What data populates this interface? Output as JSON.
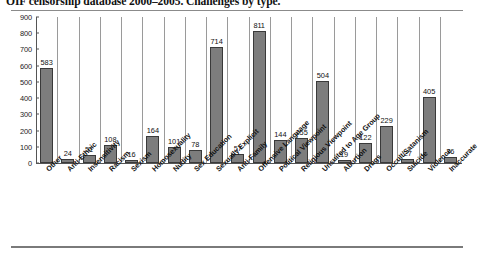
{
  "chart_data": {
    "type": "bar",
    "title": "OIF censorship database 2000–2005. Challenges by type.",
    "xlabel": "",
    "ylabel": "",
    "ylim": [
      0,
      900
    ],
    "ytick_step": 100,
    "grid": true,
    "legend": "none",
    "orientation": "vertical",
    "bar_color": "#7d7d7d",
    "categories": [
      "Other",
      "Anti-Ethnic",
      "Insensitivity",
      "Racism",
      "Sexism",
      "Homosexuality",
      "Nudity",
      "Sex Education",
      "Sexually Explicit",
      "Anti-Family",
      "Offensive Language",
      "Political Viewpoint",
      "Religious Viewpoint",
      "Unsuited to Age Group",
      "Abortion",
      "Drugs",
      "Occult/Satanism",
      "Suicide",
      "Violence",
      "Inaccurate"
    ],
    "values": [
      583,
      24,
      51,
      108,
      16,
      164,
      101,
      78,
      714,
      57,
      811,
      144,
      155,
      504,
      19,
      122,
      229,
      27,
      405,
      36
    ],
    "yticks": [
      0,
      100,
      200,
      300,
      400,
      500,
      600,
      700,
      800,
      900
    ],
    "ytick_labels": [
      "0",
      "100",
      "200",
      "300",
      "400",
      "500",
      "600",
      "700",
      "800",
      "900"
    ]
  }
}
